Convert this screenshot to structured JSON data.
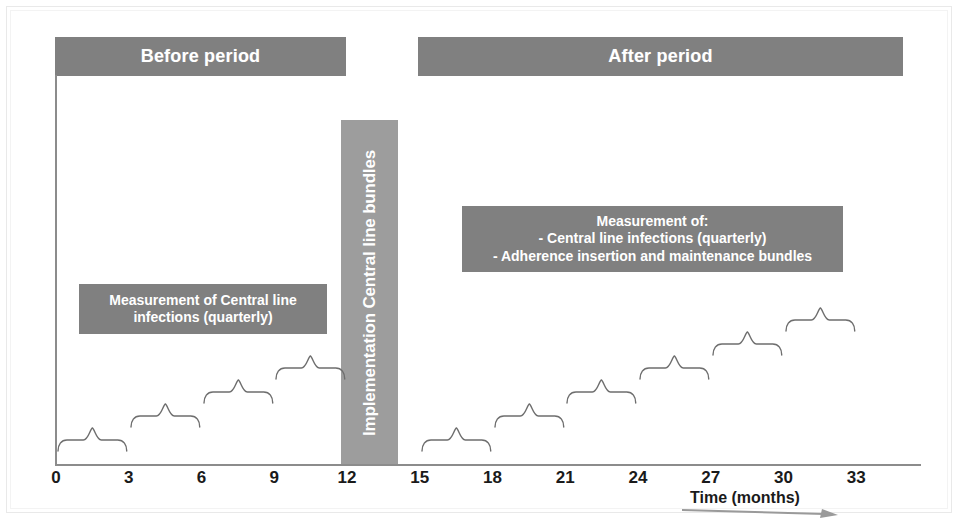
{
  "periods": {
    "before_label": "Before period",
    "after_label": "After period"
  },
  "implementation": {
    "label": "Implementation Central line bundles",
    "start_month": 12,
    "end_month": 15
  },
  "notes": {
    "before": {
      "line1": "Measurement of Central line",
      "line2": "infections (quarterly)"
    },
    "after": {
      "line1": "Measurement of:",
      "line2": "- Central line infections (quarterly)",
      "line3": "- Adherence insertion and maintenance bundles"
    }
  },
  "axis": {
    "x_caption": "Time (months)",
    "x_arrow_icon": "right-arrow-icon",
    "ticks": [
      {
        "label": "0",
        "value": 0
      },
      {
        "label": "3",
        "value": 3
      },
      {
        "label": "6",
        "value": 6
      },
      {
        "label": "9",
        "value": 9
      },
      {
        "label": "12",
        "value": 12
      },
      {
        "label": "15",
        "value": 15
      },
      {
        "label": "18",
        "value": 18
      },
      {
        "label": "21",
        "value": 21
      },
      {
        "label": "24",
        "value": 24
      },
      {
        "label": "27",
        "value": 27
      },
      {
        "label": "30",
        "value": 30
      },
      {
        "label": "33",
        "value": 33
      }
    ]
  },
  "colors": {
    "bar_gray": "#808080",
    "impl_gray": "#9d9d9d",
    "axis_gray": "#8c8c8c",
    "text_white": "#ffffff",
    "text_dark": "#1a1a1a",
    "brace_stroke": "#6e6e6e"
  },
  "chart_data": {
    "type": "timeline",
    "xlabel": "Time (months)",
    "xlim": [
      0,
      35.6
    ],
    "grid": false,
    "legend": null,
    "x_ticks": [
      0,
      3,
      6,
      9,
      12,
      15,
      18,
      21,
      24,
      27,
      30,
      33
    ],
    "phases": [
      {
        "name": "Before period",
        "start_month": 0,
        "end_month": 12
      },
      {
        "name": "Implementation Central line bundles",
        "start_month": 12,
        "end_month": 15
      },
      {
        "name": "After period",
        "start_month": 15,
        "end_month": 35
      }
    ],
    "measurement_brackets": [
      {
        "phase": "before",
        "index": 1,
        "start_month": 0,
        "end_month": 3,
        "level": 1
      },
      {
        "phase": "before",
        "index": 2,
        "start_month": 3,
        "end_month": 6,
        "level": 2
      },
      {
        "phase": "before",
        "index": 3,
        "start_month": 6,
        "end_month": 9,
        "level": 3
      },
      {
        "phase": "before",
        "index": 4,
        "start_month": 9,
        "end_month": 12,
        "level": 4
      },
      {
        "phase": "after",
        "index": 1,
        "start_month": 15,
        "end_month": 18,
        "level": 1
      },
      {
        "phase": "after",
        "index": 2,
        "start_month": 18,
        "end_month": 21,
        "level": 2
      },
      {
        "phase": "after",
        "index": 3,
        "start_month": 21,
        "end_month": 24,
        "level": 3
      },
      {
        "phase": "after",
        "index": 4,
        "start_month": 24,
        "end_month": 27,
        "level": 4
      },
      {
        "phase": "after",
        "index": 5,
        "start_month": 27,
        "end_month": 30,
        "level": 5
      },
      {
        "phase": "after",
        "index": 6,
        "start_month": 30,
        "end_month": 33,
        "level": 6
      }
    ],
    "annotations": [
      {
        "text": "Measurement of Central line infections (quarterly)",
        "phase": "before"
      },
      {
        "text": "Measurement of: - Central line infections (quarterly) - Adherence insertion and maintenance bundles",
        "phase": "after"
      }
    ]
  }
}
